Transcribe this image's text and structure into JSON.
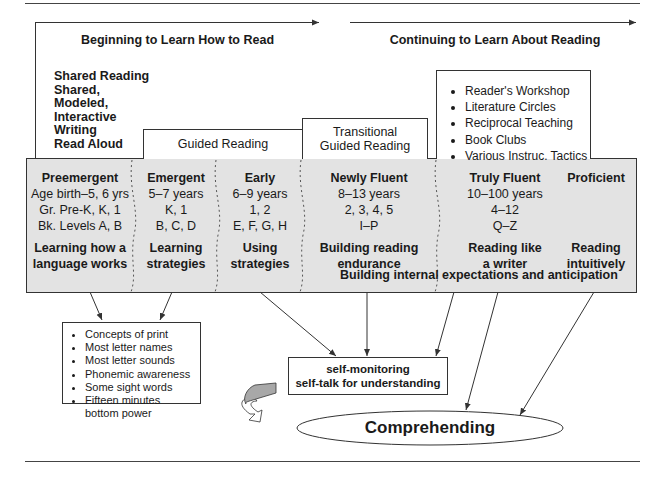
{
  "headers": {
    "left": "Beginning to Learn How to Read",
    "right": "Continuing to Learn About Reading"
  },
  "shared_reading_list": [
    "Shared Reading",
    "Shared,",
    "Modeled,",
    "Interactive",
    "Writing",
    "Read Aloud"
  ],
  "guided_reading_label": "Guided Reading",
  "transitional_label": [
    "Transitional",
    "Guided Reading"
  ],
  "tactics_list": [
    "Reader's Workshop",
    "Literature Circles",
    "Reciprocal Teaching",
    "Book Clubs",
    "Various Instruc. Tactics"
  ],
  "stages": [
    {
      "title": "Preemergent",
      "age": "Age birth–5, 6 yrs",
      "grade": "Gr. Pre-K, K, 1",
      "levels": "Bk. Levels A, B",
      "goal": [
        "Learning how a",
        "language works"
      ]
    },
    {
      "title": "Emergent",
      "age": "5–7 years",
      "grade": "K, 1",
      "levels": "B, C, D",
      "goal": [
        "Learning",
        "strategies"
      ]
    },
    {
      "title": "Early",
      "age": "6–9 years",
      "grade": "1, 2",
      "levels": "E, F, G, H",
      "goal": [
        "Using",
        "strategies"
      ]
    },
    {
      "title": "Newly Fluent",
      "age": "8–13 years",
      "grade": "2, 3, 4, 5",
      "levels": "I–P",
      "goal": [
        "Building reading",
        "endurance"
      ]
    },
    {
      "title": "Truly Fluent",
      "age": "10–100 years",
      "grade": "4–12",
      "levels": "Q–Z",
      "goal": [
        "Reading like",
        "a writer"
      ]
    },
    {
      "title": "Proficient",
      "age": "",
      "grade": "",
      "levels": "",
      "goal": [
        "Reading",
        "intuitively"
      ]
    }
  ],
  "expectations_label": "Building internal expectations and anticipation",
  "early_skills": [
    "Concepts of print",
    "Most letter names",
    "Most letter sounds",
    "Phonemic awareness",
    "Some sight words",
    "Fifteen minutes bottom power"
  ],
  "self_monitoring": [
    "self-monitoring",
    "self-talk for understanding"
  ],
  "comprehending_label": "Comprehending",
  "colors": {
    "stage_fill": "#e3e3e3",
    "line": "#333333",
    "cycle_arrow_fill": "#a8a8a8"
  }
}
